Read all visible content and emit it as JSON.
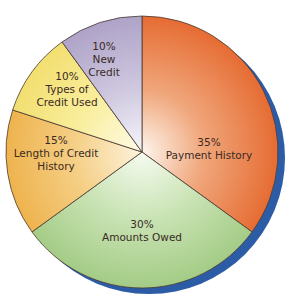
{
  "chart_data": {
    "type": "pie",
    "title": "",
    "start_angle_deg": 0,
    "direction": "clockwise",
    "categories": [
      "Payment History",
      "Amounts Owed",
      "Length of Credit History",
      "Types of Credit Used",
      "New Credit"
    ],
    "values": [
      35,
      30,
      15,
      10,
      10
    ],
    "unit": "%",
    "labels": [
      {
        "pct": "35%",
        "lines": [
          "Payment History"
        ]
      },
      {
        "pct": "30%",
        "lines": [
          "Amounts Owed"
        ]
      },
      {
        "pct": "15%",
        "lines": [
          "Length of Credit",
          "History"
        ]
      },
      {
        "pct": "10%",
        "lines": [
          "Types of",
          "Credit Used"
        ]
      },
      {
        "pct": "10%",
        "lines": [
          "New",
          "Credit"
        ]
      }
    ],
    "colors": [
      "#e8773e",
      "#a9cf8c",
      "#efb755",
      "#f4e27a",
      "#b3a9cc"
    ],
    "shadow_color": "#2d5ca6",
    "legend": "none (labels inside slices)"
  }
}
